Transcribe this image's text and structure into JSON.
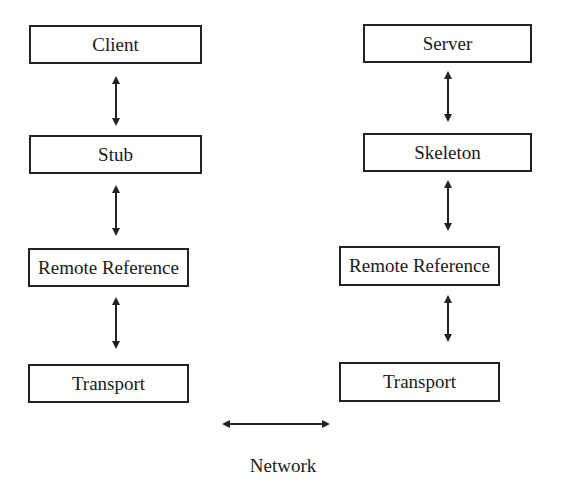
{
  "diagram": {
    "client_side": {
      "layers": [
        {
          "label": "Client"
        },
        {
          "label": "Stub"
        },
        {
          "label": "Remote Reference"
        },
        {
          "label": "Transport"
        }
      ]
    },
    "server_side": {
      "layers": [
        {
          "label": "Server"
        },
        {
          "label": "Skeleton"
        },
        {
          "label": "Remote Reference"
        },
        {
          "label": "Transport"
        }
      ]
    },
    "network": {
      "label": "Network"
    },
    "colors": {
      "stroke": "#222222",
      "background": "#ffffff"
    }
  }
}
